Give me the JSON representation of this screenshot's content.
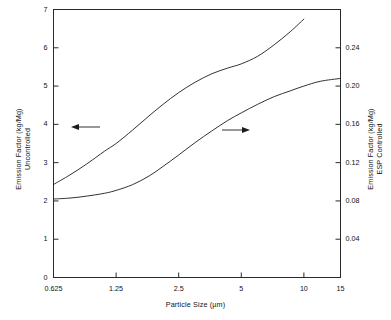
{
  "chart_data": {
    "type": "line",
    "title": "",
    "xlabel": "Particle Size (µm)",
    "ylabel_left": "Emission Factor (kg/Mg)\nUncontrolled",
    "ylabel_right": "Emission Factor (kg/Mg)\nESP Controlled",
    "xscale": "log",
    "xlim": [
      0.625,
      15
    ],
    "xticks": [
      0.625,
      1.25,
      2.5,
      5,
      10,
      15
    ],
    "xticklabels": [
      "0.625",
      "1.25",
      "2.5",
      "5",
      "10",
      "15"
    ],
    "ylim_left": [
      0,
      7
    ],
    "yticks_left": [
      0,
      1,
      2,
      3,
      4,
      5,
      6,
      7
    ],
    "yticklabels_left": [
      "0",
      "1",
      "2",
      "3",
      "4",
      "5",
      "6",
      "7"
    ],
    "ylim_right": [
      0,
      0.28
    ],
    "yticks_right": [
      0.04,
      0.08,
      0.12,
      0.16,
      0.2,
      0.24
    ],
    "yticklabels_right": [
      "0.04",
      "0.08",
      "0.12",
      "0.16",
      "0.20",
      "0.24"
    ],
    "grid": false,
    "legend": "arrows",
    "series": [
      {
        "name": "Uncontrolled",
        "axis": "left",
        "annotation": "left-arrow",
        "x": [
          0.625,
          0.75,
          0.9,
          1.1,
          1.25,
          1.5,
          1.8,
          2.1,
          2.5,
          3.0,
          3.6,
          4.3,
          5.0,
          6.0,
          7.2,
          8.6,
          10.0
        ],
        "values": [
          2.43,
          2.68,
          2.96,
          3.3,
          3.5,
          3.85,
          4.22,
          4.52,
          4.83,
          5.1,
          5.32,
          5.47,
          5.58,
          5.78,
          6.08,
          6.42,
          6.75
        ]
      },
      {
        "name": "ESP Controlled",
        "axis": "right",
        "annotation": "right-arrow",
        "x": [
          0.625,
          0.75,
          0.9,
          1.1,
          1.25,
          1.5,
          1.8,
          2.1,
          2.5,
          3.0,
          3.6,
          4.3,
          5.0,
          6.0,
          7.2,
          8.6,
          10.0,
          12.0,
          15.0
        ],
        "values": [
          0.082,
          0.083,
          0.085,
          0.088,
          0.091,
          0.097,
          0.106,
          0.116,
          0.128,
          0.141,
          0.153,
          0.164,
          0.172,
          0.181,
          0.189,
          0.195,
          0.2,
          0.205,
          0.208
        ],
        "values_left_scale": [
          2.05,
          2.08,
          2.12,
          2.2,
          2.27,
          2.43,
          2.65,
          2.9,
          3.2,
          3.52,
          3.82,
          4.1,
          4.3,
          4.53,
          4.72,
          4.88,
          5.0,
          5.12,
          5.2
        ]
      }
    ],
    "annotations": [
      {
        "name": "uncontrolled-arrow",
        "direction": "left",
        "x_px": 100,
        "y_px": 127
      },
      {
        "name": "esp-arrow",
        "direction": "right",
        "x_px": 222,
        "y_px": 130
      }
    ]
  }
}
